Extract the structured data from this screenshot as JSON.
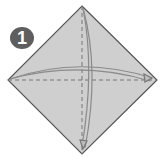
{
  "step": {
    "number": "1"
  },
  "colors": {
    "paper": "#cfcfcf",
    "edge": "#555555",
    "arrow": "#8a8a8a",
    "badge": "#5e5e5e"
  },
  "diagram": {
    "shape": "square-on-diagonal",
    "folds": [
      {
        "type": "valley-fold",
        "orientation": "horizontal",
        "direction": "left-to-right"
      },
      {
        "type": "valley-fold",
        "orientation": "vertical",
        "direction": "top-to-bottom"
      }
    ]
  }
}
